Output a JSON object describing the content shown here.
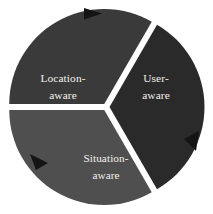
{
  "diagram": {
    "type": "three-segment-circular-cycle",
    "title": "",
    "background_color": "#ffffff",
    "gap_color": "#ffffff",
    "center": {
      "x": 106,
      "y": 107
    },
    "radius": 95,
    "gap_width_px": 7,
    "flow_direction": "clockwise",
    "segments": [
      {
        "id": "location-aware",
        "label_line1": "Location-",
        "label_line2": "aware",
        "position": "left",
        "fill_color": "#3a3a3a",
        "text_color": "#f2f0ec",
        "start_angle_deg": 180,
        "end_angle_deg": 300,
        "label_x": 63,
        "label_y": 82
      },
      {
        "id": "user-aware",
        "label_line1": "User-",
        "label_line2": "aware",
        "position": "right",
        "fill_color": "#2a2a2a",
        "text_color": "#f2f0ec",
        "start_angle_deg": 300,
        "end_angle_deg": 60,
        "label_x": 156,
        "label_y": 82
      },
      {
        "id": "situation-aware",
        "label_line1": "Situation-",
        "label_line2": "aware",
        "position": "bottom",
        "fill_color": "#4f4f4f",
        "text_color": "#f2f0ec",
        "start_angle_deg": 60,
        "end_angle_deg": 180,
        "label_x": 106,
        "label_y": 162
      }
    ],
    "arrows": [
      {
        "id": "arrow-top",
        "color": "#141414",
        "points": "84,8 102,13.5 84,19.5",
        "direction": "clockwise-right",
        "at_segment": "location-aware"
      },
      {
        "id": "arrow-right",
        "color": "#141414",
        "points": "199,131 196,151 184,139",
        "direction": "clockwise-down-left",
        "at_segment": "user-aware"
      },
      {
        "id": "arrow-bottom-left",
        "color": "#141414",
        "points": "30,154 48,163 36,170",
        "direction": "clockwise-up-left",
        "at_segment": "situation-aware"
      }
    ]
  }
}
